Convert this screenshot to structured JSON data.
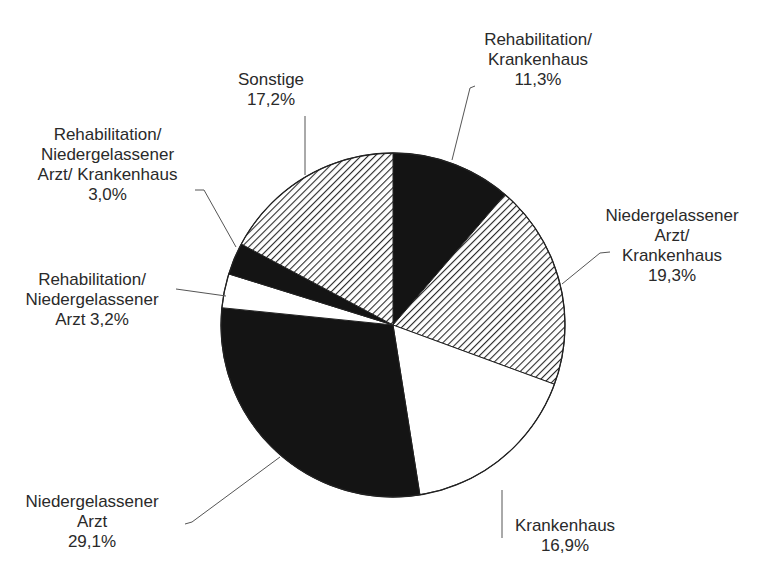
{
  "chart_data": {
    "type": "pie",
    "title": "",
    "start_angle_deg": 0,
    "direction": "clockwise",
    "center": [
      393,
      325
    ],
    "radius": 172,
    "slices": [
      {
        "label": "Rehabilitation/ Krankenhaus",
        "value": 11.3,
        "value_label": "11,3%",
        "fill": "solid",
        "color": "#141414"
      },
      {
        "label": "Niedergelassener Arzt/ Krankenhaus",
        "value": 19.3,
        "value_label": "19,3%",
        "fill": "hatch",
        "color": "#2a2a2a"
      },
      {
        "label": "Krankenhaus",
        "value": 16.9,
        "value_label": "16,9%",
        "fill": "none",
        "color": "#ffffff"
      },
      {
        "label": "Niedergelassener Arzt",
        "value": 29.1,
        "value_label": "29,1%",
        "fill": "solid",
        "color": "#141414"
      },
      {
        "label": "Rehabilitation/ Niedergelassener Arzt",
        "value": 3.2,
        "value_label": "3,2%",
        "fill": "none",
        "color": "#ffffff"
      },
      {
        "label": "Rehabilitation/ Niedergelassener Arzt/ Krankenhaus",
        "value": 3.0,
        "value_label": "3,0%",
        "fill": "solid",
        "color": "#141414"
      },
      {
        "label": "Sonstige",
        "value": 17.2,
        "value_label": "17,2%",
        "fill": "hatch",
        "color": "#2a2a2a"
      }
    ],
    "legend": "none",
    "unit": "%"
  },
  "labels": [
    {
      "id": "rehab-kh",
      "lines": [
        "Rehabilitation/",
        "Krankenhaus",
        "11,3%"
      ],
      "x": 463,
      "y": 30,
      "w": 150
    },
    {
      "id": "na-kh",
      "lines": [
        "Niedergelassener",
        "Arzt/",
        "Krankenhaus",
        "19,3%"
      ],
      "x": 592,
      "y": 206,
      "w": 160
    },
    {
      "id": "kh",
      "lines": [
        "Krankenhaus",
        "16,9%"
      ],
      "x": 500,
      "y": 516,
      "w": 130
    },
    {
      "id": "na",
      "lines": [
        "Niedergelassener",
        "Arzt",
        "29,1%"
      ],
      "x": 12,
      "y": 492,
      "w": 160
    },
    {
      "id": "rehab-na",
      "lines": [
        "Rehabilitation/",
        "Niedergelassener",
        "Arzt 3,2%"
      ],
      "x": 12,
      "y": 270,
      "w": 160
    },
    {
      "id": "rehab-na-kh",
      "lines": [
        "Rehabilitation/",
        "Niedergelassener",
        "Arzt/ Krankenhaus",
        "3,0%"
      ],
      "x": 20,
      "y": 125,
      "w": 175
    },
    {
      "id": "sonstige",
      "lines": [
        "Sonstige",
        "17,2%"
      ],
      "x": 221,
      "y": 70,
      "w": 100
    }
  ],
  "leaders": [
    {
      "id": "rehab-kh",
      "points": [
        [
          475,
          86
        ],
        [
          470,
          88
        ],
        [
          452,
          160
        ]
      ]
    },
    {
      "id": "na-kh",
      "points": [
        [
          610,
          252
        ],
        [
          600,
          253
        ],
        [
          562,
          284
        ]
      ]
    },
    {
      "id": "kh",
      "points": [
        [
          502,
          538
        ],
        [
          502,
          490
        ]
      ]
    },
    {
      "id": "na",
      "points": [
        [
          185,
          524
        ],
        [
          192,
          522
        ],
        [
          280,
          457
        ]
      ]
    },
    {
      "id": "rehab-na",
      "points": [
        [
          176,
          289
        ],
        [
          226,
          296
        ]
      ]
    },
    {
      "id": "rehab-na-kh",
      "points": [
        [
          195,
          190
        ],
        [
          204,
          190
        ],
        [
          236,
          247
        ]
      ]
    },
    {
      "id": "sonstige",
      "points": [
        [
          305,
          116
        ],
        [
          305,
          175
        ]
      ]
    }
  ]
}
